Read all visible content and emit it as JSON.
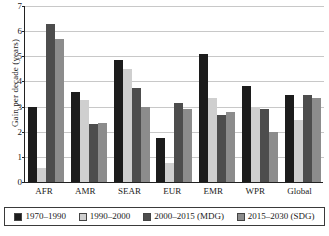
{
  "chart_data": {
    "type": "bar",
    "title": "",
    "xlabel": "",
    "ylabel": "Gain per decade (years)",
    "ylim": [
      0,
      7
    ],
    "yticks": [
      0,
      1,
      2,
      3,
      4,
      5,
      6,
      7
    ],
    "ytick_labels": [
      "0",
      "1",
      "2",
      "3",
      "4",
      "5",
      "6",
      "7"
    ],
    "grid": true,
    "legend_position": "bottom",
    "categories": [
      "AFR",
      "AMR",
      "SEAR",
      "EUR",
      "EMR",
      "WPR",
      "Global"
    ],
    "series": [
      {
        "name": "1970–1990",
        "color": "#1c1c1c",
        "values": [
          3.0,
          3.6,
          4.85,
          1.75,
          5.1,
          3.8,
          3.45
        ]
      },
      {
        "name": "1990–2000",
        "color": "#cfcfcf",
        "values": [
          0.55,
          3.25,
          4.5,
          0.75,
          3.35,
          3.0,
          2.45
        ]
      },
      {
        "name": "2000–2015 (MDG)",
        "color": "#4d4d4d",
        "values": [
          6.3,
          2.3,
          3.75,
          3.15,
          2.65,
          2.9,
          3.45
        ]
      },
      {
        "name": "2015–2030 (SDG)",
        "color": "#8c8c8c",
        "values": [
          5.7,
          2.35,
          3.0,
          2.9,
          2.8,
          2.0,
          3.35
        ]
      }
    ]
  }
}
